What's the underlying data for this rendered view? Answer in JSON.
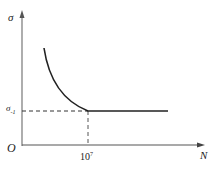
{
  "diagram": {
    "y_axis_label": "σ",
    "limit_label": "σ",
    "limit_label_sub": "-1",
    "origin_label": "O",
    "x_axis_label": "N",
    "x_tick_base": "10",
    "x_tick_exp": "7",
    "colors": {
      "axis": "#666666",
      "curve": "#222222",
      "dash": "#333333"
    }
  }
}
